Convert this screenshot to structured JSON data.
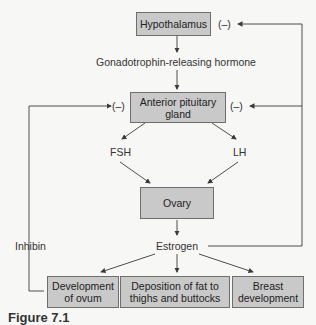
{
  "diagram": {
    "nodes": {
      "hypothalamus": "Hypothalamus",
      "anterior_pituitary": "Anterior pituitary gland",
      "ovary": "Ovary",
      "development_ovum": "Development of ovum",
      "deposition_fat": "Deposition of fat to thighs and buttocks",
      "breast_development": "Breast development"
    },
    "labels": {
      "gnrh": "Gonadotrophin-releasing hormone",
      "fsh": "FSH",
      "lh": "LH",
      "estrogen": "Estrogen",
      "inhibin": "Inhibin",
      "neg_hypothalamus": "(–)",
      "neg_pituitary_left": "(–)",
      "neg_pituitary_right": "(–)"
    },
    "caption": "Figure 7.1"
  },
  "colors": {
    "box_fill": "#c9c9c9",
    "box_border": "#6e6e6e",
    "line": "#3a3a3a",
    "background": "#f7f7f5"
  }
}
